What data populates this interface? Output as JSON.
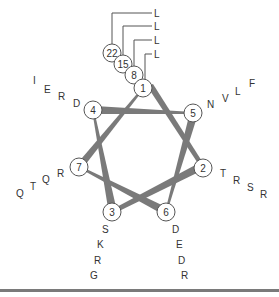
{
  "diagram": {
    "type": "helical-wheel",
    "colors": {
      "line": "#7a7a7a",
      "circle_stroke": "#555555",
      "text": "#333333"
    },
    "positions": [
      {
        "id": "1",
        "x": 143,
        "y": 88
      },
      {
        "id": "2",
        "x": 203,
        "y": 168
      },
      {
        "id": "3",
        "x": 112,
        "y": 212
      },
      {
        "id": "4",
        "x": 93,
        "y": 110
      },
      {
        "id": "5",
        "x": 193,
        "y": 113
      },
      {
        "id": "6",
        "x": 166,
        "y": 212
      },
      {
        "id": "7",
        "x": 79,
        "y": 167
      },
      {
        "id": "8",
        "x": 134,
        "y": 75
      },
      {
        "id": "15",
        "x": 123,
        "y": 64
      },
      {
        "id": "22",
        "x": 112,
        "y": 53
      }
    ],
    "residues": {
      "pos1": [
        "L",
        "L",
        "L",
        "L"
      ],
      "pos2": [
        "T",
        "R",
        "S",
        "R"
      ],
      "pos3": [
        "S",
        "K",
        "R",
        "G"
      ],
      "pos4": [
        "D",
        "R",
        "E",
        "I"
      ],
      "pos5": [
        "N",
        "V",
        "L",
        "F"
      ],
      "pos6": [
        "D",
        "E",
        "D",
        "R"
      ],
      "pos7": [
        "R",
        "Q",
        "T",
        "Q"
      ]
    }
  }
}
